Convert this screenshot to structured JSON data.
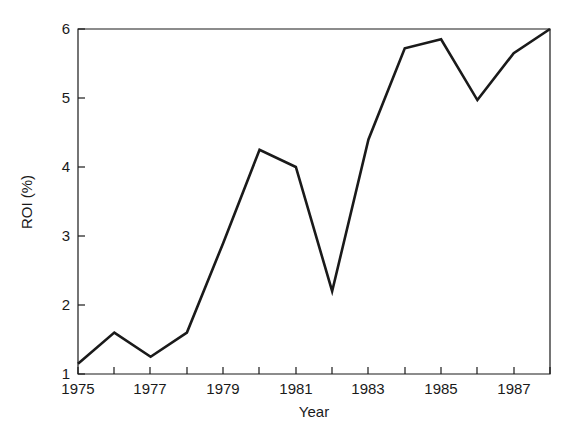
{
  "chart_data": {
    "type": "line",
    "title": "",
    "subtitle": "",
    "xlabel": "Year",
    "ylabel": "ROI (%)",
    "x": [
      1975,
      1976,
      1977,
      1978,
      1979,
      1980,
      1981,
      1982,
      1983,
      1984,
      1985,
      1986,
      1987,
      1988
    ],
    "values": [
      1.15,
      1.6,
      1.25,
      1.6,
      2.9,
      4.25,
      4.0,
      2.2,
      4.4,
      5.72,
      5.85,
      4.97,
      5.65,
      6.0
    ],
    "series": [
      {
        "name": "ROI",
        "values": [
          1.15,
          1.6,
          1.25,
          1.6,
          2.9,
          4.25,
          4.0,
          2.2,
          4.4,
          5.72,
          5.85,
          4.97,
          5.65,
          6.0
        ]
      }
    ],
    "xlim": [
      1975,
      1988
    ],
    "ylim": [
      1,
      6
    ],
    "xticks": [
      1975,
      1976,
      1977,
      1978,
      1979,
      1980,
      1981,
      1982,
      1983,
      1984,
      1985,
      1986,
      1987,
      1988
    ],
    "xticklabels": [
      "1975",
      "",
      "1977",
      "",
      "1979",
      "",
      "1981",
      "",
      "1983",
      "",
      "1985",
      "",
      "1987",
      ""
    ],
    "yticks": [
      1,
      2,
      3,
      4,
      5,
      6
    ],
    "yticklabels": [
      "1",
      "2",
      "3",
      "4",
      "5",
      "6"
    ],
    "grid": false,
    "legend": false,
    "legend_position": "none",
    "line_color": "#1a1a1a",
    "background_color": "#ffffff"
  },
  "axes": {
    "y_title": "ROI (%)",
    "x_title": "Year",
    "y_tick_1": "1",
    "y_tick_2": "2",
    "y_tick_3": "3",
    "y_tick_4": "4",
    "y_tick_5": "5",
    "y_tick_6": "6",
    "x_tick_1975": "1975",
    "x_tick_1977": "1977",
    "x_tick_1979": "1979",
    "x_tick_1981": "1981",
    "x_tick_1983": "1983",
    "x_tick_1985": "1985",
    "x_tick_1987": "1987"
  }
}
